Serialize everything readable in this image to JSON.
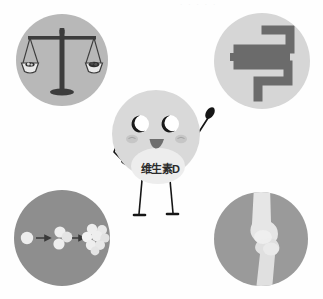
{
  "page": {
    "watermark": "· · · · ·"
  },
  "mascot": {
    "name": "vitamin-d-mascot",
    "label": "维生素D",
    "body_color": "#d9d9d9",
    "belly_color": "#ededed",
    "eye_white": "#ffffff",
    "pupil_color": "#1a1a1a",
    "cheek_color": "#c4c4c4",
    "mouth_color": "#6e6e6e",
    "limb_color": "#161616",
    "parts": [
      {
        "name": "head-body",
        "label": "身体"
      },
      {
        "name": "left-eye",
        "label": "左眼"
      },
      {
        "name": "right-eye",
        "label": "右眼"
      },
      {
        "name": "left-cheek",
        "label": "左脸颊"
      },
      {
        "name": "right-cheek",
        "label": "右脸颊"
      },
      {
        "name": "mouth",
        "label": "嘴巴"
      },
      {
        "name": "belly-patch",
        "label": "肚子"
      },
      {
        "name": "left-arm",
        "label": "左臂"
      },
      {
        "name": "right-arm",
        "label": "右臂"
      },
      {
        "name": "left-leg",
        "label": "左腿"
      },
      {
        "name": "right-leg",
        "label": "右腿"
      }
    ]
  },
  "tiles": [
    {
      "id": "scale",
      "icon": "balance-scale-icon",
      "label": "平衡天平",
      "description": "钙磷平衡",
      "position": "top-left",
      "background": "#b8b8b8",
      "icon_color": "#3c3c3c"
    },
    {
      "id": "intestine",
      "icon": "intestine-icon",
      "label": "肠道",
      "description": "促进肠道吸收",
      "position": "top-right",
      "background": "#d6d6d6",
      "icon_color": "#6b6b6b"
    },
    {
      "id": "molecule",
      "icon": "molecule-growth-icon",
      "label": "分子生长",
      "description": "细胞分化增殖",
      "position": "bottom-left",
      "background": "#8e8e8e",
      "icon_color": "#ededed"
    },
    {
      "id": "bone",
      "icon": "knee-joint-bone-icon",
      "label": "骨关节",
      "description": "骨骼健康",
      "position": "bottom-right",
      "background": "#9a9a9a",
      "icon_color": "#e6e6e6"
    }
  ]
}
